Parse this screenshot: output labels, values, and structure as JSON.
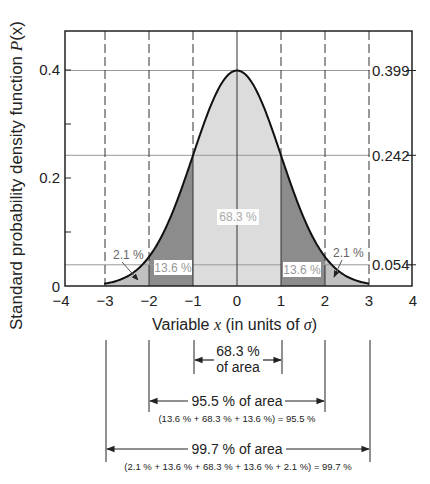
{
  "chart_data": {
    "type": "area",
    "title": "",
    "xlabel": "Variable x (in units of σ)",
    "ylabel": "Standard probability density function P(x)",
    "xlim": [
      -4,
      4
    ],
    "ylim": [
      0,
      0.45
    ],
    "x_ticks": [
      "−4",
      "−3",
      "−2",
      "−1",
      "0",
      "1",
      "2",
      "3",
      "4"
    ],
    "y_ticks": [
      "0",
      "0.2",
      "0.4"
    ],
    "right_labels": [
      "0.399",
      "0.242",
      "0.054"
    ],
    "right_label_values": [
      0.399,
      0.242,
      0.054
    ],
    "dashed_verticals": [
      -3,
      -2,
      -1,
      1,
      2,
      3
    ],
    "curve": "standard normal N(0,1)",
    "regions": [
      {
        "name": "center",
        "from": -1,
        "to": 1,
        "label": "68.3 %",
        "fill": "#dcdcdc"
      },
      {
        "name": "left-mid",
        "from": -2,
        "to": -1,
        "label": "13.6 %",
        "fill": "#8c8c8c"
      },
      {
        "name": "right-mid",
        "from": 1,
        "to": 2,
        "label": "13.6 %",
        "fill": "#8c8c8c"
      },
      {
        "name": "left-tail",
        "from": -3,
        "to": -2,
        "label": "2.1 %",
        "fill": "#c0c0c0"
      },
      {
        "name": "right-tail",
        "from": 2,
        "to": 3,
        "label": "2.1 %",
        "fill": "#c0c0c0"
      }
    ],
    "grid": false
  },
  "labels": {
    "ylabel_text": "Standard probability density function ",
    "ylabel_var": "P",
    "ylabel_arg": "(x)",
    "xlabel_text": "Variable ",
    "xlabel_var": "x",
    "xlabel_rest": " (in units of ",
    "xlabel_sigma": "σ",
    "xlabel_close": ")",
    "center_pct": "68.3 %",
    "mid_left_pct": "13.6 %",
    "mid_right_pct": "13.6 %",
    "tail_left_pct": "2.1 %",
    "tail_right_pct": "2.1 %",
    "r0399": "0.399",
    "r0242": "0.242",
    "r0054": "0.054",
    "x_ticks": [
      "−4",
      "−3",
      "−2",
      "−1",
      "0",
      "1",
      "2",
      "3",
      "4"
    ],
    "y_0": "0",
    "y_02": "0.2",
    "y_04": "0.4"
  },
  "annotations": {
    "one_sigma_line1": "68.3 %",
    "one_sigma_line2": "of area",
    "two_sigma_label": "95.5 % of area",
    "two_sigma_formula": "(13.6 % + 68.3 % + 13.6 %) = 95.5 %",
    "three_sigma_label": "99.7 % of area",
    "three_sigma_formula": "(2.1 % + 13.6 % + 68.3 % + 13.6 % + 2.1 %) = 99.7 %"
  }
}
